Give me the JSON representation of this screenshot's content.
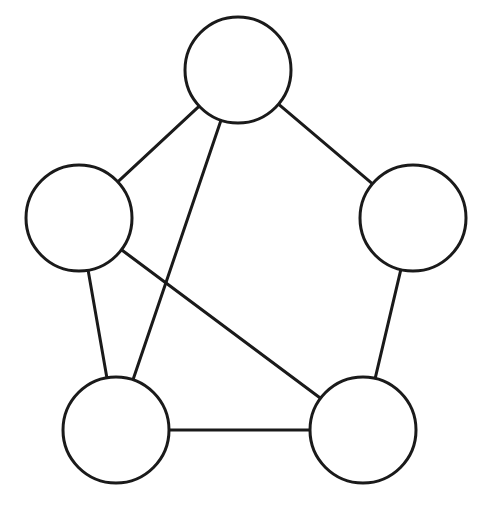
{
  "diagram": {
    "type": "undirected-graph",
    "canvas": {
      "width": 490,
      "height": 511,
      "background": "#ffffff"
    },
    "style": {
      "stroke": "#1a1a1a",
      "stroke_width": 3,
      "node_fill": "#ffffff"
    },
    "nodes": [
      {
        "id": "top",
        "cx": 238,
        "cy": 70,
        "r": 53,
        "label": ""
      },
      {
        "id": "left",
        "cx": 79,
        "cy": 218,
        "r": 53,
        "label": ""
      },
      {
        "id": "right",
        "cx": 413,
        "cy": 218,
        "r": 53,
        "label": ""
      },
      {
        "id": "bottom-left",
        "cx": 116,
        "cy": 430,
        "r": 53,
        "label": ""
      },
      {
        "id": "bottom-right",
        "cx": 363,
        "cy": 430,
        "r": 53,
        "label": ""
      }
    ],
    "edges": [
      {
        "from": "top",
        "to": "left"
      },
      {
        "from": "top",
        "to": "right"
      },
      {
        "from": "top",
        "to": "bottom-left"
      },
      {
        "from": "left",
        "to": "bottom-left"
      },
      {
        "from": "left",
        "to": "bottom-right"
      },
      {
        "from": "right",
        "to": "bottom-right"
      },
      {
        "from": "bottom-left",
        "to": "bottom-right"
      }
    ]
  }
}
